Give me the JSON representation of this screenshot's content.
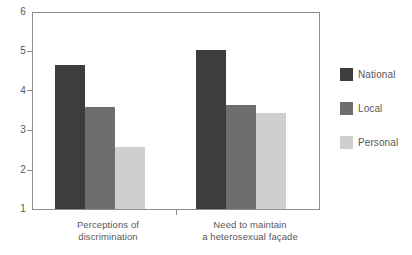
{
  "chart_data": {
    "type": "bar",
    "title": "",
    "subtitle": "",
    "xlabel": "",
    "ylabel": "",
    "ylim": [
      1,
      6
    ],
    "yticks": [
      1,
      2,
      3,
      4,
      5,
      6
    ],
    "ytick_labels": [
      "1",
      "2",
      "3",
      "4",
      "5",
      "6"
    ],
    "grid": false,
    "legend_position": "right",
    "categories": [
      "Perceptions of discrimination",
      "Need to maintain a heterosexual façade"
    ],
    "category_label_lines": [
      [
        "Perceptions of",
        "discrimination"
      ],
      [
        "Need to maintain",
        "a heterosexual façade"
      ]
    ],
    "series": [
      {
        "name": "National",
        "color": "#3d3d3f",
        "values": [
          4.68,
          5.05
        ]
      },
      {
        "name": "Local",
        "color": "#6e6e70",
        "values": [
          3.61,
          3.65
        ]
      },
      {
        "name": "Personal",
        "color": "#cfcfcf",
        "values": [
          2.57,
          3.44
        ]
      }
    ]
  },
  "axis": {
    "y_tick_labels": [
      "6",
      "5",
      "4",
      "3",
      "2",
      "1"
    ]
  },
  "legend": {
    "items": [
      {
        "label": "National",
        "color": "#3d3d3f"
      },
      {
        "label": "Local",
        "color": "#6e6e70"
      },
      {
        "label": "Personal",
        "color": "#cfcfcf"
      }
    ]
  },
  "colors": {
    "axis_line": "#8d8d8d",
    "text": "#58585a",
    "background": "#ffffff"
  }
}
